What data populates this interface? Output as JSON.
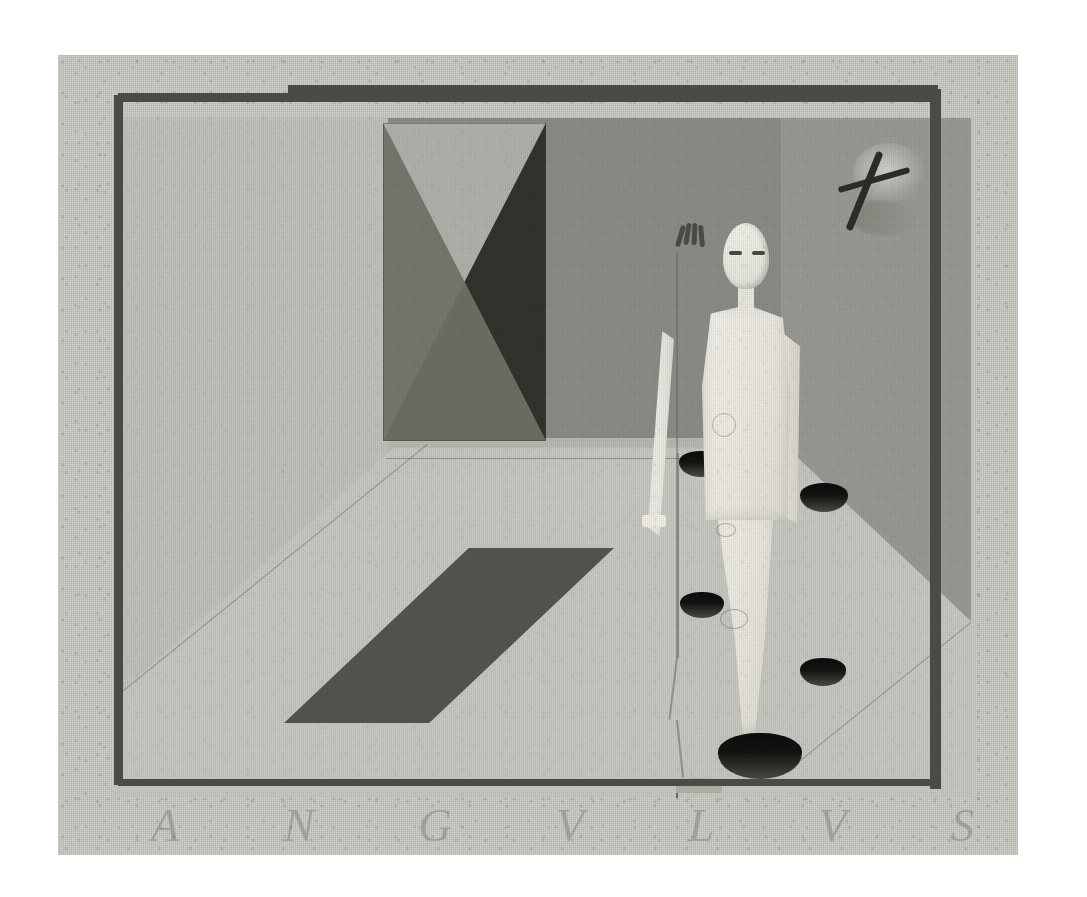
{
  "artwork": {
    "title": "ANGVLVS",
    "medium_surface": "coarse woven canvas, visible weave",
    "palette": {
      "paper_margin": "#ffffff",
      "canvas_ground": "#cfcec9",
      "wall_left": "#c2c1bb",
      "wall_back": "#8d8c88",
      "wall_right": "#9b9a95",
      "floor": "#c8c7c1",
      "floor_far_band": "#b9b8b2",
      "frame_border": "#4b4a45",
      "shadow_parallelogram": "#55544e",
      "bowtie_top": "#b2b1ab",
      "bowtie_left": "#77766f",
      "bowtie_right": "#33322d",
      "bowtie_bottom": "#6e6d66",
      "figure_robe": "#eeede6",
      "bowl_dark": "#0c0c0a",
      "bowl_inner": "#4b4a44",
      "cross_dark": "#2e2d29",
      "inscription_ink": "rgba(122,120,112,.46)"
    },
    "inscription": {
      "text": "ANGVLVS",
      "letters": [
        "A",
        "N",
        "G",
        "V",
        "L",
        "V",
        "S"
      ],
      "placement": "lower margin of canvas, faint incised capitals"
    },
    "figure": {
      "description": "standing frontal figure in pale robe",
      "head": "elongated pale oval",
      "features": [
        "eye-left",
        "eye-right",
        "nose",
        "mouth"
      ],
      "left_arm": "extended down and outward toward viewer-left",
      "hand": "splayed dark fingers",
      "robe_marks": "faint drawn curves and vertical seams"
    },
    "bowls": [
      {
        "name": "bowl-1",
        "left": 623,
        "top": 396,
        "width": 44,
        "height": 26
      },
      {
        "name": "bowl-2",
        "left": 744,
        "top": 428,
        "width": 48,
        "height": 29
      },
      {
        "name": "bowl-3",
        "left": 624,
        "top": 537,
        "width": 44,
        "height": 26
      },
      {
        "name": "bowl-4",
        "left": 744,
        "top": 603,
        "width": 46,
        "height": 28
      },
      {
        "name": "bowl-5",
        "left": 662,
        "top": 678,
        "width": 84,
        "height": 46
      }
    ],
    "motifs": {
      "bowtie": "hourglass / X of four triangles on left back wall",
      "cross": "dark tilted cross or aeroplane over pale cloud on right wall",
      "shadow": "dark parallelogram cast on the floor"
    }
  }
}
